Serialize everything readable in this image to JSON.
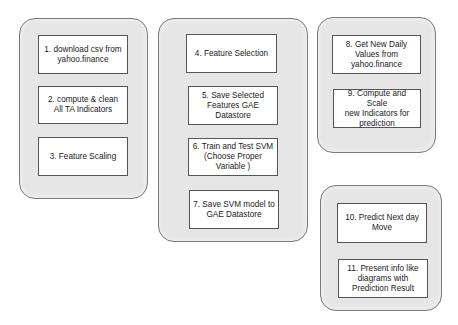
{
  "diagram": {
    "type": "process-flow",
    "colors": {
      "group_fill": "#e6e6e6",
      "group_border": "#7a7a7a",
      "step_fill": "#ffffff",
      "step_border": "#555555",
      "text": "#222222"
    },
    "groups": [
      {
        "id": "data-preparation",
        "steps": [
          {
            "label": "1. download csv from\nyahoo.finance"
          },
          {
            "label": "2. compute & clean\nAll TA Indicators"
          },
          {
            "label": "3. Feature Scaling"
          }
        ]
      },
      {
        "id": "model-training",
        "steps": [
          {
            "label": "4. Feature Selection"
          },
          {
            "label": "5. Save Selected\nFeatures GAE\nDatastore"
          },
          {
            "label": "6. Train and Test SVM\n(Choose Proper\nVariable )"
          },
          {
            "label": "7. Save SVM model to\nGAE Datastore"
          }
        ]
      },
      {
        "id": "daily-update",
        "steps": [
          {
            "label": "8. Get New Daily\nValues from\nyahoo.finance"
          },
          {
            "label": "9. Compute and Scale\nnew Indicators for\nprediction"
          }
        ]
      },
      {
        "id": "prediction-output",
        "steps": [
          {
            "label": "10. Predict Next day\nMove"
          },
          {
            "label": "11. Present info like\ndiagrams with\nPrediction Result"
          }
        ]
      }
    ]
  }
}
